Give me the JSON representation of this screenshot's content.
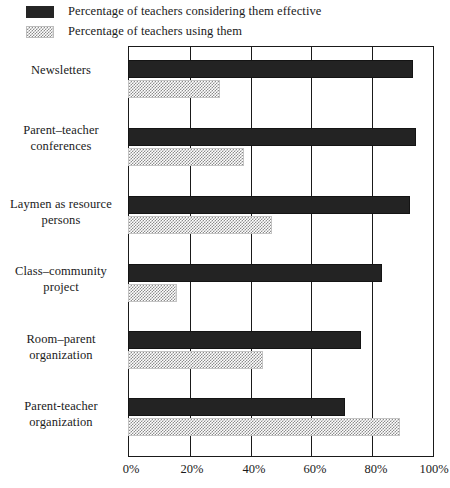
{
  "legend": {
    "position": "top-left",
    "entries": [
      {
        "swatch": "dark-solid-swatch",
        "label": "Percentage of teachers considering them effective"
      },
      {
        "swatch": "gray-hatched-swatch",
        "label": "Percentage of teachers using them"
      }
    ]
  },
  "axis": {
    "x_ticks": [
      "0%",
      "20%",
      "40%",
      "60%",
      "80%",
      "100%"
    ]
  },
  "colors": {
    "series_effective": "#232323",
    "series_using": "#8c8c8c",
    "frame": "#1a1a1a",
    "background": "#ffffff"
  },
  "categories": [
    "Newsletters",
    "Parent–teacher\nconferences",
    "Laymen as resource\npersons",
    "Class–community\nproject",
    "Room–parent\norganization",
    "Parent-teacher\norganization"
  ],
  "category_lines": [
    [
      "Newsletters"
    ],
    [
      "Parent–teacher",
      "conferences"
    ],
    [
      "Laymen as resource",
      "persons"
    ],
    [
      "Class–community",
      "project"
    ],
    [
      "Room–parent",
      "organization"
    ],
    [
      "Parent-teacher",
      "organization"
    ]
  ],
  "chart_data": {
    "type": "bar",
    "orientation": "horizontal",
    "title": "",
    "xlabel": "",
    "ylabel": "",
    "xlim": [
      0,
      100
    ],
    "xticks": [
      0,
      20,
      40,
      60,
      80,
      100
    ],
    "xtick_labels": [
      "0%",
      "20%",
      "40%",
      "60%",
      "80%",
      "100%"
    ],
    "grid": "vertical",
    "legend_position": "above-plot-left",
    "categories": [
      "Newsletters",
      "Parent–teacher conferences",
      "Laymen as resource persons",
      "Class–community project",
      "Room–parent organization",
      "Parent-teacher organization"
    ],
    "series": [
      {
        "name": "Percentage of teachers considering them effective",
        "color": "#232323",
        "values": [
          93,
          94,
          92,
          83,
          76,
          71
        ]
      },
      {
        "name": "Percentage of teachers using them",
        "color": "#8c8c8c",
        "values": [
          30,
          38,
          47,
          16,
          44,
          89
        ]
      }
    ]
  }
}
